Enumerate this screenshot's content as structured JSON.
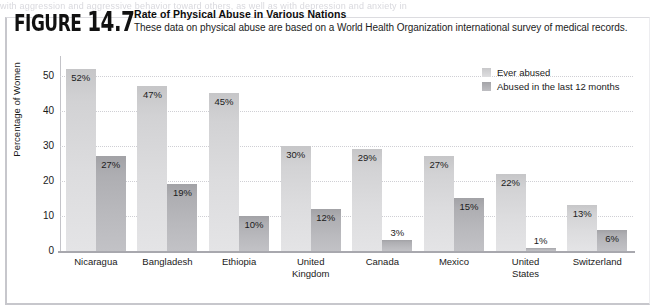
{
  "page": {
    "text_fragment": "with aggression and aggressive behavior toward others, as well as with depression and anxiety in"
  },
  "figure": {
    "number_word": "FIGURE",
    "number_value": "14.7",
    "title": "Rate of Physical Abuse in Various Nations",
    "subtitle": "These data on physical abuse are based on a World Health Organization international survey of medical records."
  },
  "chart_data": {
    "type": "bar",
    "title": "Rate of Physical Abuse in Various Nations",
    "subtitle": "These data on physical abuse are based on a World Health Organization international survey of medical records.",
    "xlabel": "",
    "ylabel": "Percentage of Women",
    "ylim": [
      0,
      55
    ],
    "yticks": [
      0,
      10,
      20,
      30,
      40,
      50
    ],
    "ytick_labels": [
      "0",
      "10",
      "20",
      "30",
      "40",
      "50"
    ],
    "grid": "horizontal-dotted",
    "legend_position": "top-right",
    "categories": [
      "Nicaragua",
      "Bangladesh",
      "Ethiopia",
      "United Kingdom",
      "Canada",
      "Mexico",
      "United States",
      "Switzerland"
    ],
    "series": [
      {
        "name": "Ever abused",
        "color": "#d4d4d6",
        "values": [
          52,
          47,
          45,
          30,
          29,
          27,
          22,
          13
        ],
        "data_labels": [
          "52%",
          "47%",
          "45%",
          "30%",
          "29%",
          "27%",
          "22%",
          "13%"
        ]
      },
      {
        "name": "Abused in the last 12 months",
        "color": "#b0b0b4",
        "values": [
          27,
          19,
          10,
          12,
          3,
          15,
          1,
          6
        ],
        "data_labels": [
          "27%",
          "19%",
          "10%",
          "12%",
          "3%",
          "15%",
          "1%",
          "6%"
        ]
      }
    ]
  },
  "category_lines": [
    [
      "Nicaragua"
    ],
    [
      "Bangladesh"
    ],
    [
      "Ethiopia"
    ],
    [
      "United",
      "Kingdom"
    ],
    [
      "Canada"
    ],
    [
      "Mexico"
    ],
    [
      "United",
      "States"
    ],
    [
      "Switzerland"
    ]
  ]
}
